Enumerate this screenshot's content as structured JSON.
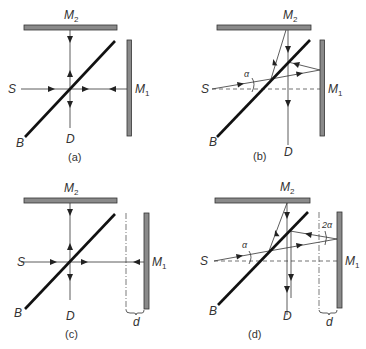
{
  "figure": {
    "panels": [
      {
        "id": "a",
        "caption": "(a)",
        "labels": {
          "source": "S",
          "detector": "D",
          "beamsplitter": "B",
          "mirror1": "M",
          "mirror1_sub": "1",
          "mirror2": "M",
          "mirror2_sub": "2"
        }
      },
      {
        "id": "b",
        "caption": "(b)",
        "labels": {
          "source": "S",
          "detector": "D",
          "beamsplitter": "B",
          "mirror1": "M",
          "mirror1_sub": "1",
          "mirror2": "M",
          "mirror2_sub": "2",
          "angle": "α"
        }
      },
      {
        "id": "c",
        "caption": "(c)",
        "labels": {
          "source": "S",
          "detector": "D",
          "beamsplitter": "B",
          "mirror1": "M",
          "mirror1_sub": "1",
          "mirror2": "M",
          "mirror2_sub": "2",
          "displacement": "d"
        }
      },
      {
        "id": "d",
        "caption": "(d)",
        "labels": {
          "source": "S",
          "detector": "D",
          "beamsplitter": "B",
          "mirror1": "M",
          "mirror1_sub": "1",
          "mirror2": "M",
          "mirror2_sub": "2",
          "angle": "α",
          "angle2": "2α",
          "displacement": "d"
        }
      }
    ]
  }
}
